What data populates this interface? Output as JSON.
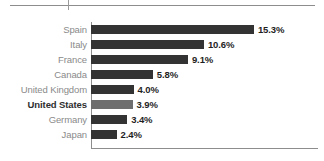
{
  "top_rule": {
    "line_color": "#8d8d8d",
    "tick_color": "#9a9a9a"
  },
  "chart_data": {
    "type": "bar",
    "orientation": "horizontal",
    "title": "",
    "subtitle": "",
    "xlabel": "",
    "ylabel": "",
    "categories": [
      "Spain",
      "Italy",
      "France",
      "Canada",
      "United Kingdom",
      "United States",
      "Germany",
      "Japan"
    ],
    "values": [
      15.3,
      10.6,
      9.1,
      5.8,
      4.0,
      3.9,
      3.4,
      2.4
    ],
    "value_labels": [
      "15.3%",
      "10.6%",
      "9.1%",
      "5.8%",
      "4.0%",
      "3.9%",
      "3.4%",
      "2.4%"
    ],
    "highlighted_category": "United States",
    "xlim": [
      0,
      15.3
    ],
    "grid": false,
    "legend": null,
    "axis_color": "#8d8d8d",
    "bar_color": "#333333",
    "highlight_bar_color": "#6e6e6e",
    "label_color": "#8a8a8a",
    "highlight_label_color": "#2e2e2e",
    "value_label_color": "#1f1f1f",
    "px_per_unit": 10.65
  }
}
